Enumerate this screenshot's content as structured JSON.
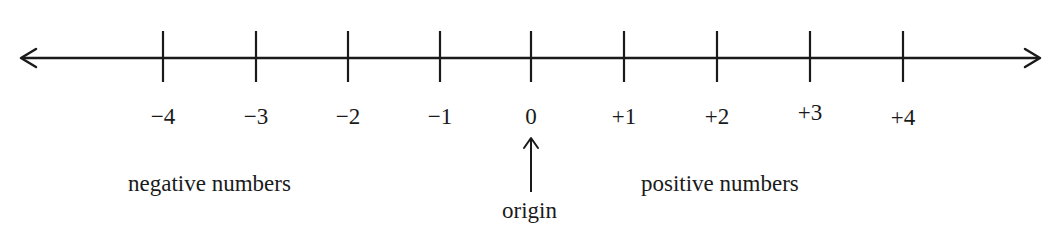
{
  "diagram": {
    "type": "number-line",
    "line_color": "#1a1a1a",
    "ticks": [
      {
        "value": -4,
        "label": "−4",
        "x": 163,
        "label_y": 105
      },
      {
        "value": -3,
        "label": "−3",
        "x": 256,
        "label_y": 105
      },
      {
        "value": -2,
        "label": "−2",
        "x": 348,
        "label_y": 105
      },
      {
        "value": -1,
        "label": "−1",
        "x": 440,
        "label_y": 105
      },
      {
        "value": 0,
        "label": "0",
        "x": 531,
        "label_y": 105
      },
      {
        "value": 1,
        "label": "+1",
        "x": 624,
        "label_y": 105
      },
      {
        "value": 2,
        "label": "+2",
        "x": 717,
        "label_y": 105
      },
      {
        "value": 3,
        "label": "+3",
        "x": 810,
        "label_y": 101
      },
      {
        "value": 4,
        "label": "+4",
        "x": 903,
        "label_y": 106
      }
    ],
    "captions": {
      "negative": "negative numbers",
      "positive": "positive numbers",
      "origin": "origin"
    }
  }
}
